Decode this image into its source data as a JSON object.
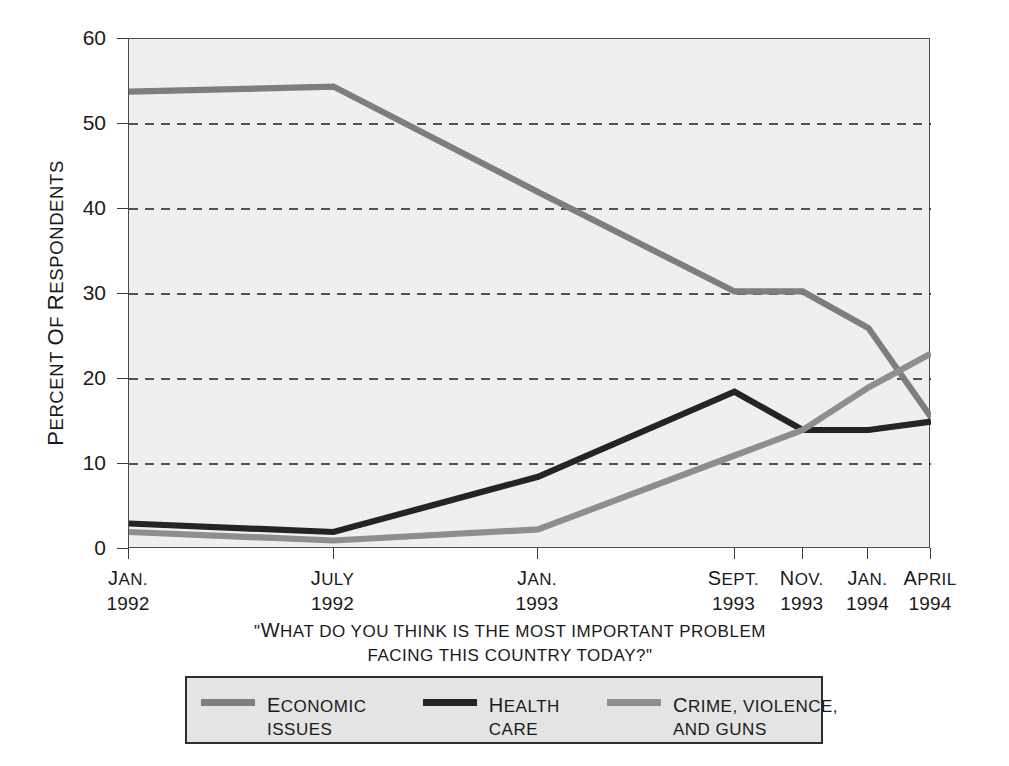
{
  "chart_data": {
    "type": "line",
    "title": "",
    "subtitle": "",
    "caption_line1": "\"WHAT DO YOU THINK IS THE MOST IMPORTANT PROBLEM",
    "caption_line2": "FACING THIS COUNTRY TODAY?\"",
    "xlabel": "",
    "ylabel": "PERCENT OF RESPONDENTS",
    "ylim": [
      0,
      60
    ],
    "yticks": [
      0,
      10,
      20,
      30,
      40,
      50,
      60
    ],
    "grid": "horizontal-dashed",
    "legend_position": "bottom",
    "categories": [
      "JAN. 1992",
      "JULY 1992",
      "JAN. 1993",
      "SEPT. 1993",
      "NOV. 1993",
      "JAN. 1994",
      "APRIL 1994"
    ],
    "x_tick_labels": [
      {
        "month": "JAN.",
        "year": "1992"
      },
      {
        "month": "JULY",
        "year": "1992"
      },
      {
        "month": "JAN.",
        "year": "1993"
      },
      {
        "month": "SEPT.",
        "year": "1993"
      },
      {
        "month": "NOV.",
        "year": "1993"
      },
      {
        "month": "JAN.",
        "year": "1994"
      },
      {
        "month": "APRIL",
        "year": "1994"
      }
    ],
    "x_positions_pct": [
      0,
      25.5,
      51.0,
      75.5,
      84.0,
      92.2,
      100
    ],
    "series": [
      {
        "name": "ECONOMIC ISSUES",
        "legend_line1": "ECONOMIC",
        "legend_line2": "ISSUES",
        "color": "#7e7e7e",
        "values": [
          53.8,
          54.4,
          42.0,
          30.3,
          30.3,
          26.0,
          15.5
        ]
      },
      {
        "name": "HEALTH CARE",
        "legend_line1": "HEALTH",
        "legend_line2": "CARE",
        "color": "#242424",
        "values": [
          3.0,
          2.0,
          8.5,
          18.5,
          14.0,
          14.0,
          15.0
        ]
      },
      {
        "name": "CRIME, VIOLENCE, AND GUNS",
        "legend_line1": "CRIME, VIOLENCE,",
        "legend_line2": "AND GUNS",
        "color": "#8e8e8e",
        "values": [
          2.0,
          1.0,
          2.3,
          11.0,
          14.0,
          19.0,
          23.0
        ]
      }
    ]
  }
}
